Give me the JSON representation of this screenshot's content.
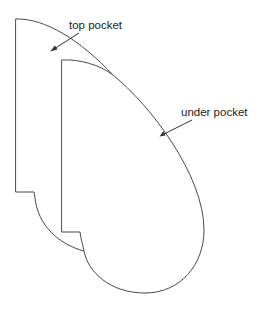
{
  "diagram": {
    "colors": {
      "outline": "#4a4a4a",
      "text": "#222222",
      "arrow": "#333333",
      "background": "#ffffff"
    },
    "labels": {
      "top_pocket": "top pocket",
      "under_pocket": "under pocket"
    },
    "shapes": [
      {
        "name": "top pocket",
        "description": "Back pocket piece with straight left edge, small step at lower left and curved right edge"
      },
      {
        "name": "under pocket",
        "description": "Front pocket piece overlapping the top pocket, straight left edge with step, large rounded teardrop right and bottom edge"
      }
    ],
    "annotations": [
      {
        "label": "top pocket",
        "arrow_from": [
          79,
          33
        ],
        "arrow_to": [
          51,
          51
        ]
      },
      {
        "label": "under pocket",
        "arrow_from": [
          192,
          120
        ],
        "arrow_to": [
          160,
          136
        ]
      }
    ]
  }
}
